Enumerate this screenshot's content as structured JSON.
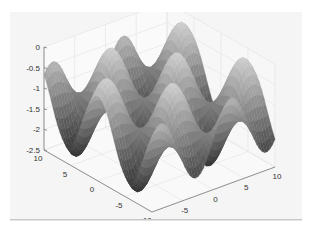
{
  "figure": {
    "background": "#f5f5f5",
    "axes_color": "#777777",
    "grid_color": "#ffffff"
  },
  "chart_data": {
    "type": "surface",
    "title": "",
    "xlabel": "",
    "ylabel": "",
    "zlabel": "",
    "x_range": [
      -10,
      10
    ],
    "y_range": [
      -10,
      10
    ],
    "z_range": [
      -2.5,
      0
    ],
    "x_ticks": [
      -10,
      -5,
      0,
      5,
      10
    ],
    "y_ticks": [
      -10,
      -5,
      0,
      5,
      10
    ],
    "z_ticks": [
      0,
      -0.5,
      -1,
      -1.5,
      -2,
      -2.5
    ],
    "z_tick_labels": [
      "0",
      "-0.5",
      "-1",
      "-1.5",
      "-2",
      "-2.5"
    ],
    "x_tick_labels": [
      "-10",
      "-5",
      "0",
      "5",
      "10"
    ],
    "y_tick_labels": [
      "10",
      "5",
      "0",
      "-5",
      "-10"
    ],
    "grid": true,
    "box": "3d-axes-back-walls",
    "colormap": "gray",
    "surface_description": "egg-crate oscillating surface with ~4 peaks and ~4 valleys along each visible ridge, values between about -2.5 and -0.1",
    "function_hint": "z = -1.25 + 1.15*sin(0.55*x)*cos(0.55*y) approximated",
    "legend": null
  }
}
